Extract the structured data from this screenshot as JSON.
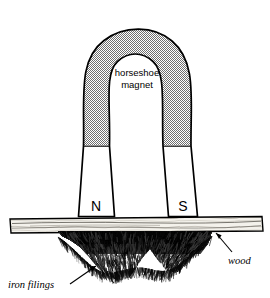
{
  "figure": {
    "background_color": "#ffffff",
    "ink_color": "#000000",
    "magnet_fill_color": "#9a9a9a",
    "pole_fill_color": "#ffffff",
    "wood_fill_color": "#f2f0ea",
    "filings_color": "#111111"
  },
  "magnet": {
    "caption_line1": "horseshoe",
    "caption_line2": "magnet",
    "north_pole_label": "N",
    "south_pole_label": "S"
  },
  "annotations": {
    "wood_label": "wood",
    "iron_filings_label": "iron filings"
  }
}
